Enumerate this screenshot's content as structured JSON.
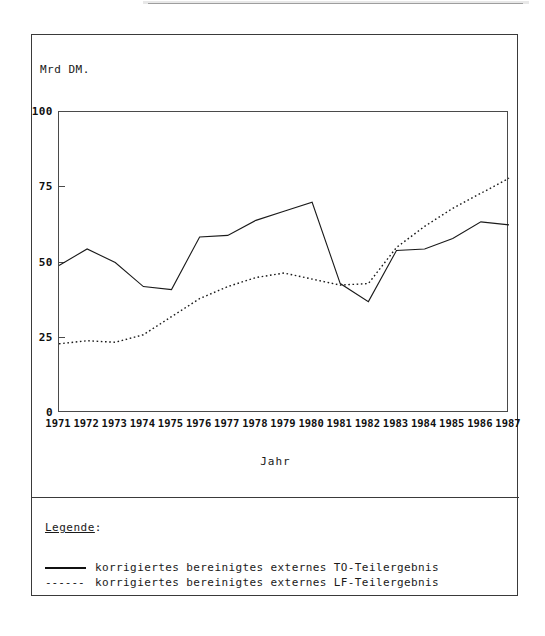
{
  "figure": {
    "y_axis_title": "Mrd DM.",
    "x_axis_title": "Jahr"
  },
  "legend": {
    "heading_underlined": "Legende",
    "heading_colon": ":",
    "dashed_swatch_glyph": "------",
    "items": [
      {
        "style": "solid",
        "label": "korrigiertes bereinigtes externes TO-Teilergebnis"
      },
      {
        "style": "dashed",
        "label": "korrigiertes bereinigtes externes LF-Teilergebnis"
      }
    ]
  },
  "chart_data": {
    "type": "line",
    "title": "",
    "xlabel": "Jahr",
    "ylabel": "Mrd DM.",
    "xlim": [
      1971,
      1987
    ],
    "ylim": [
      0,
      100
    ],
    "yticks": [
      0,
      25,
      50,
      75,
      100
    ],
    "ytick_labels": [
      "0",
      "25",
      "50",
      "75",
      "100"
    ],
    "grid": false,
    "legend_position": "below-plot",
    "x": [
      1971,
      1972,
      1973,
      1974,
      1975,
      1976,
      1977,
      1978,
      1979,
      1980,
      1981,
      1982,
      1983,
      1984,
      1985,
      1986,
      1987
    ],
    "xtick_labels": [
      "1971",
      "1972",
      "1973",
      "1974",
      "1975",
      "1976",
      "1977",
      "1978",
      "1979",
      "1980",
      "1981",
      "1982",
      "1983",
      "1984",
      "1985",
      "1986",
      "1987"
    ],
    "series": [
      {
        "name": "korrigiertes bereinigtes externes TO-Teilergebnis",
        "style": "solid",
        "color": "#1a1a1a",
        "values": [
          49,
          54.5,
          50,
          42,
          41,
          58.5,
          59,
          64,
          67,
          70,
          43,
          37,
          54,
          54.5,
          58,
          63.5,
          62.5
        ]
      },
      {
        "name": "korrigiertes bereinigtes externes LF-Teilergebnis",
        "style": "dotted",
        "color": "#1a1a1a",
        "values": [
          23,
          24,
          23.5,
          26,
          32,
          38,
          42,
          45,
          46.5,
          44.5,
          42.5,
          43,
          55,
          62,
          68,
          73,
          78
        ]
      }
    ]
  }
}
